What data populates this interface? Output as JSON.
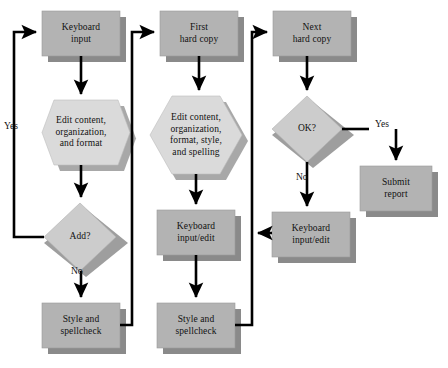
{
  "diagram": {
    "colors": {
      "box_fill": "#b3b3b3",
      "box_shadow": "#8a8a8a",
      "hex_fill": "#d8d8d8",
      "hex_shadow": "#a8a8a8",
      "diamond_fill": "#cccccc",
      "diamond_shadow": "#9e9e9e",
      "line": "#000000",
      "text": "#111111",
      "background": "#ffffff"
    },
    "nodes": [
      {
        "id": "keyboard-input",
        "shape": "process",
        "lines": [
          "Keyboard",
          "input"
        ],
        "x": 42,
        "y": 11,
        "w": 78,
        "h": 45
      },
      {
        "id": "edit-content-1",
        "shape": "preparation",
        "lines": [
          "Edit content,",
          "organization,",
          "and format"
        ],
        "x": 38,
        "y": 100,
        "w": 86,
        "h": 65
      },
      {
        "id": "add-decision",
        "shape": "decision",
        "lines": [
          "Add?"
        ],
        "x": 44,
        "y": 203,
        "w": 72,
        "h": 68
      },
      {
        "id": "style-spellcheck-1",
        "shape": "process",
        "lines": [
          "Style and",
          "spellcheck"
        ],
        "x": 42,
        "y": 303,
        "w": 78,
        "h": 45
      },
      {
        "id": "first-hard-copy",
        "shape": "process",
        "lines": [
          "First",
          "hard copy"
        ],
        "x": 160,
        "y": 11,
        "w": 78,
        "h": 45
      },
      {
        "id": "edit-content-2",
        "shape": "preparation",
        "lines": [
          "Edit content,",
          "organization,",
          "format, style,",
          "and spelling"
        ],
        "x": 152,
        "y": 96,
        "w": 90,
        "h": 78
      },
      {
        "id": "keyboard-input-edit-1",
        "shape": "process",
        "lines": [
          "Keyboard",
          "input/edit"
        ],
        "x": 157,
        "y": 210,
        "w": 78,
        "h": 45
      },
      {
        "id": "style-spellcheck-2",
        "shape": "process",
        "lines": [
          "Style and",
          "spellcheck"
        ],
        "x": 157,
        "y": 303,
        "w": 78,
        "h": 45
      },
      {
        "id": "next-hard-copy",
        "shape": "process",
        "lines": [
          "Next",
          "hard copy"
        ],
        "x": 273,
        "y": 11,
        "w": 78,
        "h": 45
      },
      {
        "id": "ok-decision",
        "shape": "decision",
        "lines": [
          "OK?"
        ],
        "x": 272,
        "y": 96,
        "w": 70,
        "h": 66
      },
      {
        "id": "keyboard-input-edit-2",
        "shape": "process",
        "lines": [
          "Keyboard",
          "input/edit"
        ],
        "x": 272,
        "y": 212,
        "w": 78,
        "h": 45
      },
      {
        "id": "submit-report",
        "shape": "process",
        "lines": [
          "Submit",
          "report"
        ],
        "x": 360,
        "y": 166,
        "w": 72,
        "h": 45
      }
    ],
    "edge_labels": [
      {
        "id": "yes-left",
        "text": "Yes",
        "x": 4,
        "y": 121
      },
      {
        "id": "no-add",
        "text": "No",
        "x": 71,
        "y": 266
      },
      {
        "id": "yes-ok",
        "text": "Yes",
        "x": 375,
        "y": 119
      },
      {
        "id": "no-ok",
        "text": "No",
        "x": 296,
        "y": 172
      }
    ]
  }
}
